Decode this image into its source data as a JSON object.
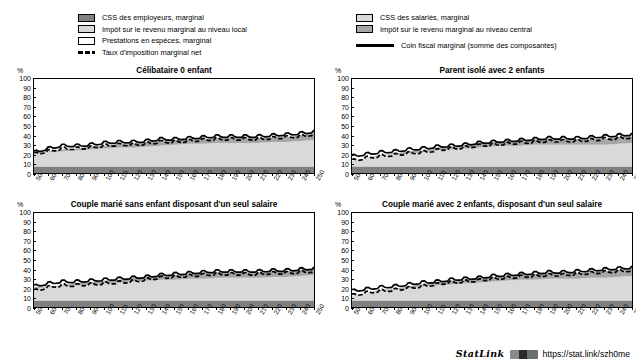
{
  "legend": {
    "left_items": [
      {
        "key": "css-employeurs",
        "label": "CSS des employeurs, marginal",
        "swatch": "dark"
      },
      {
        "key": "impot-local",
        "label": "Impôt sur le revenu marginal au niveau local",
        "swatch": "light"
      },
      {
        "key": "prestations",
        "label": "Prestations en espèces, marginal",
        "swatch": "white"
      },
      {
        "key": "taux-net",
        "label": "Taux d'imposition marginal net",
        "swatch": "dashed-line"
      }
    ],
    "right_items": [
      {
        "key": "css-salaries",
        "label": "CSS des salariés, marginal",
        "swatch": "light"
      },
      {
        "key": "impot-central",
        "label": "Impôt sur le revenu marginal au niveau central",
        "swatch": "mid"
      },
      {
        "key": "coin-fiscal",
        "label": "Coin fiscal marginal (somme des composantes)",
        "swatch": "solid-line"
      }
    ]
  },
  "colors": {
    "css_employeurs": "#808080",
    "css_salaries": "#d9d9d9",
    "impot_central": "#a6a6a6",
    "impot_local": "#d9d9d9",
    "prestations": "#ffffff",
    "line": "#000000",
    "axis": "#000000"
  },
  "axis": {
    "y_unit": "%",
    "y_ticks": [
      0,
      10,
      20,
      30,
      40,
      50,
      60,
      70,
      80,
      90,
      100
    ],
    "ylim": [
      0,
      100
    ],
    "x_ticks": [
      50,
      60,
      70,
      80,
      90,
      100,
      110,
      120,
      130,
      140,
      150,
      160,
      170,
      180,
      190,
      200,
      210,
      220,
      230,
      240,
      250
    ],
    "xlim": [
      50,
      250
    ]
  },
  "footer": {
    "statlink_word": "StatLink",
    "statlink_icon": "barcode-icon",
    "url": "https://stat.link/szh0me"
  },
  "chart_data": [
    {
      "id": "celibataire-0-enfant",
      "type": "area",
      "title": "Célibataire 0 enfant",
      "xlabel": "",
      "ylabel": "%",
      "ylim": [
        0,
        100
      ],
      "xlim": [
        50,
        250
      ],
      "grid": false,
      "legend_position": "top",
      "x": [
        50,
        60,
        70,
        80,
        90,
        100,
        110,
        120,
        130,
        140,
        150,
        160,
        170,
        180,
        190,
        200,
        210,
        220,
        230,
        240,
        250
      ],
      "series": [
        {
          "name": "CSS des employeurs, marginal",
          "values": [
            7,
            7,
            7,
            7,
            7,
            7,
            7,
            7,
            7,
            7,
            7,
            7,
            7,
            7,
            7,
            7,
            7,
            7,
            7,
            7,
            7
          ]
        },
        {
          "name": "CSS des salariés, marginal",
          "values": [
            14,
            15,
            16,
            17,
            18,
            19,
            20,
            20,
            21,
            22,
            23,
            24,
            24,
            25,
            25,
            25,
            25,
            26,
            26,
            27,
            28
          ]
        },
        {
          "name": "Impôt sur le revenu marginal au niveau central",
          "values": [
            1,
            1,
            2,
            2,
            3,
            3,
            4,
            4,
            5,
            5,
            5,
            5,
            5,
            5,
            5,
            5,
            5,
            5,
            5,
            6,
            7
          ]
        },
        {
          "name": "Impôt sur le revenu marginal au niveau local",
          "values": [
            0,
            0,
            0,
            0,
            0,
            0,
            0,
            0,
            0,
            0,
            0,
            0,
            0,
            0,
            0,
            0,
            0,
            0,
            0,
            0,
            0
          ]
        },
        {
          "name": "Prestations en espèces, marginal",
          "values": [
            0,
            0,
            0,
            0,
            0,
            0,
            0,
            0,
            0,
            0,
            0,
            0,
            0,
            0,
            0,
            0,
            0,
            0,
            0,
            0,
            0
          ]
        }
      ],
      "lines": [
        {
          "name": "Coin fiscal marginal (somme des composantes)",
          "style": "solid",
          "values": [
            21,
            25,
            28,
            28,
            29,
            31,
            32,
            32,
            33,
            35,
            35,
            36,
            37,
            38,
            38,
            38,
            38,
            39,
            40,
            41,
            43
          ]
        },
        {
          "name": "Taux d'imposition marginal net",
          "style": "dashed",
          "values": [
            19,
            22,
            25,
            25,
            26,
            28,
            29,
            29,
            30,
            32,
            32,
            33,
            34,
            35,
            35,
            35,
            35,
            36,
            37,
            38,
            40
          ]
        }
      ]
    },
    {
      "id": "parent-isole-2-enfants",
      "type": "area",
      "title": "Parent isolé avec 2 enfants",
      "xlabel": "",
      "ylabel": "%",
      "ylim": [
        0,
        100
      ],
      "xlim": [
        50,
        250
      ],
      "grid": false,
      "legend_position": "top",
      "x": [
        50,
        60,
        70,
        80,
        90,
        100,
        110,
        120,
        130,
        140,
        150,
        160,
        170,
        180,
        190,
        200,
        210,
        220,
        230,
        240,
        250
      ],
      "series": [
        {
          "name": "CSS des employeurs, marginal",
          "values": [
            7,
            7,
            7,
            7,
            7,
            7,
            7,
            7,
            7,
            7,
            7,
            7,
            7,
            7,
            7,
            7,
            7,
            7,
            7,
            7,
            7
          ]
        },
        {
          "name": "CSS des salariés, marginal",
          "values": [
            6,
            9,
            11,
            12,
            14,
            15,
            17,
            18,
            19,
            20,
            21,
            22,
            22,
            23,
            23,
            23,
            23,
            23,
            23,
            24,
            25
          ]
        },
        {
          "name": "Impôt sur le revenu marginal au niveau central",
          "values": [
            0,
            0,
            1,
            1,
            2,
            2,
            3,
            3,
            4,
            5,
            5,
            5,
            6,
            6,
            6,
            6,
            6,
            6,
            6,
            7,
            7
          ]
        },
        {
          "name": "Impôt sur le revenu marginal au niveau local",
          "values": [
            0,
            0,
            0,
            0,
            0,
            0,
            0,
            0,
            0,
            0,
            0,
            0,
            0,
            0,
            0,
            0,
            0,
            0,
            0,
            0,
            0
          ]
        },
        {
          "name": "Prestations en espèces, marginal",
          "values": [
            0,
            0,
            0,
            0,
            0,
            0,
            0,
            0,
            0,
            0,
            0,
            0,
            0,
            0,
            0,
            0,
            0,
            0,
            0,
            0,
            0
          ]
        }
      ],
      "lines": [
        {
          "name": "Coin fiscal marginal (somme des composantes)",
          "style": "solid",
          "values": [
            17,
            19,
            21,
            22,
            24,
            25,
            27,
            28,
            29,
            31,
            32,
            33,
            34,
            35,
            36,
            36,
            36,
            37,
            38,
            39,
            40
          ]
        },
        {
          "name": "Taux d'imposition marginal net",
          "style": "dashed",
          "values": [
            12,
            15,
            17,
            18,
            20,
            21,
            23,
            25,
            26,
            28,
            29,
            30,
            31,
            32,
            33,
            33,
            33,
            34,
            35,
            36,
            37
          ]
        }
      ]
    },
    {
      "id": "couple-marie-sans-enfant",
      "type": "area",
      "title": "Couple marié sans enfant disposant d'un seul salaire",
      "xlabel": "",
      "ylabel": "%",
      "ylim": [
        0,
        100
      ],
      "xlim": [
        50,
        250
      ],
      "grid": false,
      "legend_position": "top",
      "x": [
        50,
        60,
        70,
        80,
        90,
        100,
        110,
        120,
        130,
        140,
        150,
        160,
        170,
        180,
        190,
        200,
        210,
        220,
        230,
        240,
        250
      ],
      "series": [
        {
          "name": "CSS des employeurs, marginal",
          "values": [
            7,
            7,
            7,
            7,
            7,
            7,
            7,
            7,
            7,
            7,
            7,
            7,
            7,
            7,
            7,
            7,
            7,
            7,
            7,
            7,
            7
          ]
        },
        {
          "name": "CSS des salariés, marginal",
          "values": [
            13,
            14,
            15,
            16,
            17,
            18,
            19,
            20,
            21,
            22,
            22,
            23,
            23,
            24,
            24,
            24,
            24,
            25,
            25,
            26,
            27
          ]
        },
        {
          "name": "Impôt sur le revenu marginal au niveau central",
          "values": [
            1,
            1,
            1,
            2,
            2,
            3,
            3,
            4,
            4,
            5,
            5,
            5,
            6,
            6,
            6,
            6,
            6,
            6,
            6,
            7,
            7
          ]
        },
        {
          "name": "Impôt sur le revenu marginal au niveau local",
          "values": [
            0,
            0,
            0,
            0,
            0,
            0,
            0,
            0,
            0,
            0,
            0,
            0,
            0,
            0,
            0,
            0,
            0,
            0,
            0,
            0,
            0
          ]
        },
        {
          "name": "Prestations en espèces, marginal",
          "values": [
            0,
            0,
            0,
            0,
            0,
            0,
            0,
            0,
            0,
            0,
            0,
            0,
            0,
            0,
            0,
            0,
            0,
            0,
            0,
            0,
            0
          ]
        }
      ],
      "lines": [
        {
          "name": "Coin fiscal marginal (somme des composantes)",
          "style": "solid",
          "values": [
            21,
            24,
            26,
            26,
            27,
            28,
            29,
            30,
            31,
            33,
            34,
            35,
            36,
            37,
            37,
            37,
            37,
            38,
            38,
            39,
            40
          ]
        },
        {
          "name": "Taux d'imposition marginal net",
          "style": "dashed",
          "values": [
            16,
            20,
            22,
            22,
            23,
            24,
            25,
            26,
            28,
            30,
            31,
            32,
            33,
            34,
            34,
            34,
            34,
            35,
            35,
            36,
            37
          ]
        }
      ]
    },
    {
      "id": "couple-marie-2-enfants",
      "type": "area",
      "title": "Couple marié avec 2 enfants, disposant d'un seul salaire",
      "xlabel": "",
      "ylabel": "%",
      "ylim": [
        0,
        100
      ],
      "xlim": [
        50,
        250
      ],
      "grid": false,
      "legend_position": "top",
      "x": [
        50,
        60,
        70,
        80,
        90,
        100,
        110,
        120,
        130,
        140,
        150,
        160,
        170,
        180,
        190,
        200,
        210,
        220,
        230,
        240,
        250
      ],
      "series": [
        {
          "name": "CSS des employeurs, marginal",
          "values": [
            7,
            7,
            7,
            7,
            7,
            7,
            7,
            7,
            7,
            7,
            7,
            7,
            7,
            7,
            7,
            7,
            7,
            7,
            7,
            7,
            7
          ]
        },
        {
          "name": "CSS des salariés, marginal",
          "values": [
            5,
            8,
            10,
            11,
            13,
            15,
            16,
            17,
            18,
            19,
            20,
            21,
            22,
            22,
            23,
            23,
            23,
            24,
            24,
            25,
            26
          ]
        },
        {
          "name": "Impôt sur le revenu marginal au niveau central",
          "values": [
            0,
            0,
            1,
            1,
            2,
            2,
            3,
            4,
            4,
            5,
            5,
            5,
            6,
            6,
            6,
            6,
            6,
            6,
            7,
            7,
            8
          ]
        },
        {
          "name": "Impôt sur le revenu marginal au niveau local",
          "values": [
            0,
            0,
            0,
            0,
            0,
            0,
            0,
            0,
            0,
            0,
            0,
            0,
            0,
            0,
            0,
            0,
            0,
            0,
            0,
            0,
            0
          ]
        },
        {
          "name": "Prestations en espèces, marginal",
          "values": [
            0,
            0,
            0,
            0,
            0,
            0,
            0,
            0,
            0,
            0,
            0,
            0,
            0,
            0,
            0,
            0,
            0,
            0,
            0,
            0,
            0
          ]
        }
      ],
      "lines": [
        {
          "name": "Coin fiscal marginal (somme des composantes)",
          "style": "solid",
          "values": [
            16,
            18,
            20,
            21,
            23,
            25,
            26,
            28,
            29,
            30,
            32,
            33,
            34,
            35,
            36,
            36,
            37,
            38,
            39,
            40,
            41
          ]
        },
        {
          "name": "Taux d'imposition marginal net",
          "style": "dashed",
          "values": [
            11,
            14,
            16,
            17,
            19,
            21,
            23,
            25,
            26,
            27,
            29,
            30,
            31,
            32,
            33,
            33,
            34,
            35,
            36,
            37,
            38
          ]
        }
      ]
    }
  ]
}
